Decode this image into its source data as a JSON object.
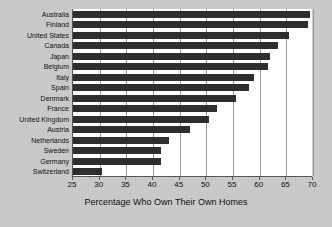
{
  "chart_data": {
    "type": "bar",
    "orientation": "horizontal",
    "title": "",
    "xlabel": "Percentage Who Own Their Own Homes",
    "ylabel": "",
    "xlim": [
      25,
      70
    ],
    "ylim": null,
    "grid": true,
    "legend": null,
    "xticks": [
      25,
      30,
      35,
      40,
      45,
      50,
      55,
      60,
      65,
      70
    ],
    "xtick_labels": [
      "25",
      "30",
      "35",
      "40",
      "45",
      "50",
      "55",
      "60",
      "65",
      "70"
    ],
    "categories": [
      "Australia",
      "Finland",
      "United States",
      "Canada",
      "Japan",
      "Belgium",
      "Italy",
      "Spain",
      "Denmark",
      "France",
      "United Kingdom",
      "Austria",
      "Netherlands",
      "Sweden",
      "Germany",
      "Switzerland"
    ],
    "values": [
      69.5,
      69,
      65.5,
      63.5,
      62,
      61.5,
      59,
      58,
      55.5,
      52,
      50.5,
      47,
      43,
      41.5,
      41.5,
      30.5
    ],
    "bar_color": "#2e2e2e",
    "plot_background": "#ffffff",
    "figure_background": "#c9c9c9",
    "gridline_color": "#9a9a9a",
    "axis_color": "#555555"
  }
}
